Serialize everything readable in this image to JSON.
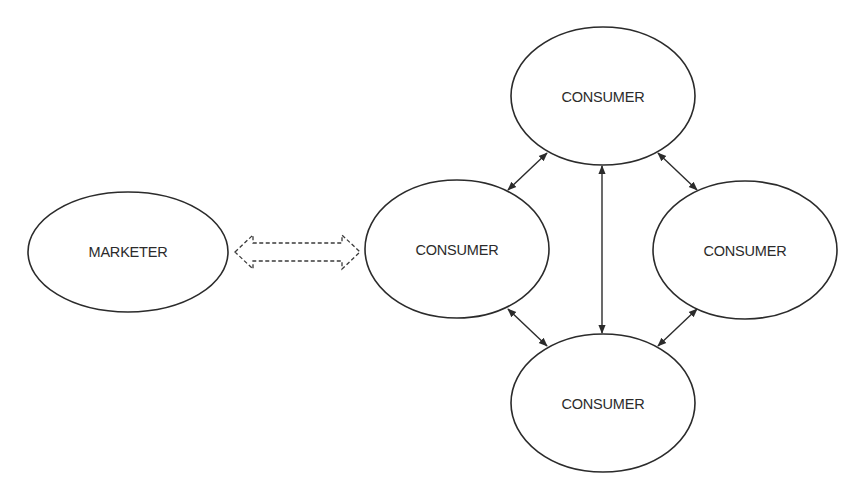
{
  "diagram": {
    "type": "relationship-network",
    "nodes": [
      {
        "id": "marketer",
        "label": "MARKETER",
        "cx": 128,
        "cy": 252,
        "rx": 100,
        "ry": 60
      },
      {
        "id": "consumer-top",
        "label": "CONSUMER",
        "cx": 603,
        "cy": 96,
        "rx": 92,
        "ry": 69
      },
      {
        "id": "consumer-left",
        "label": "CONSUMER",
        "cx": 457,
        "cy": 249,
        "rx": 92,
        "ry": 69
      },
      {
        "id": "consumer-right",
        "label": "CONSUMER",
        "cx": 745,
        "cy": 250,
        "rx": 92,
        "ry": 69
      },
      {
        "id": "consumer-bottom",
        "label": "CONSUMER",
        "cx": 603,
        "cy": 403,
        "rx": 92,
        "ry": 69
      }
    ],
    "edges": [
      {
        "from": "marketer",
        "to": "consumer-left",
        "style": "dashed-block-double-arrow"
      },
      {
        "from": "consumer-top",
        "to": "consumer-left",
        "style": "solid-double-arrow"
      },
      {
        "from": "consumer-top",
        "to": "consumer-right",
        "style": "solid-double-arrow"
      },
      {
        "from": "consumer-top",
        "to": "consumer-bottom",
        "style": "solid-double-arrow"
      },
      {
        "from": "consumer-left",
        "to": "consumer-bottom",
        "style": "solid-double-arrow"
      },
      {
        "from": "consumer-right",
        "to": "consumer-bottom",
        "style": "solid-double-arrow"
      }
    ],
    "colors": {
      "stroke": "#2b2b2b",
      "background": "#ffffff"
    }
  },
  "labels": {
    "marketer": "MARKETER",
    "consumer_top": "CONSUMER",
    "consumer_left": "CONSUMER",
    "consumer_right": "CONSUMER",
    "consumer_bottom": "CONSUMER"
  }
}
